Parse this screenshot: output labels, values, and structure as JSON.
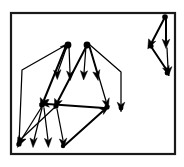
{
  "figure": {
    "kind": "node-link-diagram",
    "caption": "",
    "colors": {
      "background": "#ffffff",
      "frame_stroke": "#1a1a1a",
      "edge_stroke": "#000000",
      "node_fill": "#000000"
    },
    "frame": {
      "x": 10,
      "y": 12,
      "width": 166,
      "height": 143,
      "stroke_width": 2.2
    },
    "canvas": {
      "width": 184,
      "height": 167
    }
  },
  "graph_data": {
    "type": "directed-graph",
    "node_count": 18,
    "edge_count": 22,
    "components": 2,
    "nodes": [
      {
        "id": "n1",
        "label": "",
        "x": 68,
        "y": 45,
        "r": 3.4,
        "cluster": "main"
      },
      {
        "id": "n2",
        "label": "",
        "x": 87,
        "y": 45,
        "r": 3.4,
        "cluster": "main"
      },
      {
        "id": "n3",
        "label": "",
        "x": 57,
        "y": 77,
        "r": 2.6,
        "cluster": "main"
      },
      {
        "id": "n4",
        "label": "",
        "x": 70,
        "y": 78,
        "r": 2.6,
        "cluster": "main"
      },
      {
        "id": "n5",
        "label": "",
        "x": 84,
        "y": 77,
        "r": 2.6,
        "cluster": "main"
      },
      {
        "id": "n6",
        "label": "",
        "x": 97,
        "y": 78,
        "r": 2.6,
        "cluster": "main"
      },
      {
        "id": "n7",
        "label": "",
        "x": 22,
        "y": 70,
        "r": 1.6,
        "cluster": "main"
      },
      {
        "id": "n8",
        "label": "",
        "x": 121,
        "y": 72,
        "r": 1.6,
        "cluster": "main"
      },
      {
        "id": "n9",
        "label": "",
        "x": 42,
        "y": 105,
        "r": 3.0,
        "cluster": "main"
      },
      {
        "id": "n10",
        "label": "",
        "x": 56,
        "y": 106,
        "r": 3.0,
        "cluster": "main"
      },
      {
        "id": "n11",
        "label": "",
        "x": 107,
        "y": 107,
        "r": 3.0,
        "cluster": "main"
      },
      {
        "id": "n12",
        "label": "",
        "x": 120,
        "y": 109,
        "r": 3.0,
        "cluster": "main"
      },
      {
        "id": "n13",
        "label": "",
        "x": 20,
        "y": 145,
        "r": 2.6,
        "cluster": "main"
      },
      {
        "id": "n14",
        "label": "",
        "x": 34,
        "y": 145,
        "r": 2.6,
        "cluster": "main"
      },
      {
        "id": "n15",
        "label": "",
        "x": 48,
        "y": 145,
        "r": 2.6,
        "cluster": "main"
      },
      {
        "id": "n16",
        "label": "",
        "x": 63,
        "y": 146,
        "r": 2.6,
        "cluster": "main"
      },
      {
        "id": "r1",
        "label": "",
        "x": 165,
        "y": 17,
        "r": 2.8,
        "cluster": "right"
      },
      {
        "id": "r2",
        "label": "",
        "x": 151,
        "y": 46,
        "r": 2.8,
        "cluster": "right"
      },
      {
        "id": "r3",
        "label": "",
        "x": 166,
        "y": 45,
        "r": 2.6,
        "cluster": "right"
      },
      {
        "id": "r4",
        "label": "",
        "x": 167,
        "y": 73,
        "r": 2.8,
        "cluster": "right"
      }
    ],
    "edges": [
      {
        "from": "n1",
        "to": "n3",
        "directed": true,
        "weight": 1
      },
      {
        "from": "n1",
        "to": "n4",
        "directed": true,
        "weight": 1
      },
      {
        "from": "n1",
        "to": "n9",
        "directed": true,
        "weight": 2
      },
      {
        "from": "n2",
        "to": "n5",
        "directed": true,
        "weight": 1
      },
      {
        "from": "n2",
        "to": "n6",
        "directed": true,
        "weight": 1
      },
      {
        "from": "n2",
        "to": "n10",
        "directed": true,
        "weight": 2
      },
      {
        "from": "n2",
        "to": "n11",
        "directed": true,
        "weight": 1
      },
      {
        "from": "n2",
        "to": "n12",
        "directed": true,
        "weight": 1
      },
      {
        "from": "n7",
        "to": "n1",
        "directed": true,
        "weight": 1
      },
      {
        "from": "n13",
        "to": "n7",
        "directed": false,
        "weight": 1
      },
      {
        "from": "n8",
        "to": "n12",
        "directed": true,
        "weight": 1
      },
      {
        "from": "n2",
        "to": "n8",
        "directed": false,
        "weight": 1
      },
      {
        "from": "n9",
        "to": "n13",
        "directed": true,
        "weight": 1
      },
      {
        "from": "n9",
        "to": "n14",
        "directed": true,
        "weight": 1
      },
      {
        "from": "n9",
        "to": "n15",
        "directed": true,
        "weight": 1
      },
      {
        "from": "n10",
        "to": "n13",
        "directed": true,
        "weight": 1
      },
      {
        "from": "n10",
        "to": "n16",
        "directed": true,
        "weight": 1
      },
      {
        "from": "n11",
        "to": "n9",
        "directed": true,
        "weight": 2
      },
      {
        "from": "n16",
        "to": "n11",
        "directed": true,
        "weight": 2
      },
      {
        "from": "r1",
        "to": "r2",
        "directed": true,
        "weight": 2
      },
      {
        "from": "r1",
        "to": "r3",
        "directed": true,
        "weight": 2
      },
      {
        "from": "r2",
        "to": "r4",
        "directed": true,
        "weight": 2
      },
      {
        "from": "r3",
        "to": "r4",
        "directed": true,
        "weight": 1
      }
    ]
  }
}
